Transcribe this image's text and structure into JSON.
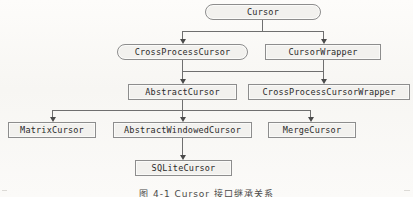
{
  "figure": {
    "kind": "class-hierarchy-diagram",
    "caption": "图 4-1  Cursor 接口继承关系",
    "colors": {
      "page_background": "#fbfaf8",
      "node_fill": "#f2f1ee",
      "node_border": "#8d8d8d",
      "connector": "#6f6f6f",
      "arrow": "#4a4a4a",
      "text": "#2a2a2a"
    }
  },
  "nodes": [
    {
      "id": "cursor",
      "label": "Cursor",
      "shape": "rounded",
      "level": 1,
      "x": 205,
      "y": 4,
      "w": 116,
      "h": 16
    },
    {
      "id": "cross_process_cursor",
      "label": "CrossProcessCursor",
      "shape": "rounded",
      "level": 2,
      "x": 117,
      "y": 44,
      "w": 131,
      "h": 16
    },
    {
      "id": "cursor_wrapper",
      "label": "CursorWrapper",
      "shape": "rectangle",
      "level": 2,
      "x": 265,
      "y": 44,
      "w": 116,
      "h": 16
    },
    {
      "id": "abstract_cursor",
      "label": "AbstractCursor",
      "shape": "rectangle",
      "level": 3,
      "x": 128,
      "y": 84,
      "w": 109,
      "h": 16
    },
    {
      "id": "cross_process_cursor_wrap",
      "label": "CrossProcessCursorWrapper",
      "shape": "rectangle",
      "level": 3,
      "x": 248,
      "y": 84,
      "w": 162,
      "h": 16
    },
    {
      "id": "matrix_cursor",
      "label": "MatrixCursor",
      "shape": "rectangle",
      "level": 4,
      "x": 8,
      "y": 122,
      "w": 88,
      "h": 16
    },
    {
      "id": "abstract_windowed_cursor",
      "label": "AbstractWindowedCursor",
      "shape": "rectangle",
      "level": 4,
      "x": 113,
      "y": 122,
      "w": 139,
      "h": 16
    },
    {
      "id": "merge_cursor",
      "label": "MergeCursor",
      "shape": "rectangle",
      "level": 4,
      "x": 268,
      "y": 122,
      "w": 88,
      "h": 16
    },
    {
      "id": "sqlite_cursor",
      "label": "SQLiteCursor",
      "shape": "rectangle",
      "level": 5,
      "x": 135,
      "y": 160,
      "w": 97,
      "h": 16
    }
  ],
  "edges": [
    {
      "from": "cursor",
      "to": "cross_process_cursor"
    },
    {
      "from": "cursor",
      "to": "cursor_wrapper"
    },
    {
      "from": "cross_process_cursor",
      "to": "abstract_cursor"
    },
    {
      "from": "cursor_wrapper",
      "to": "cross_process_cursor_wrap"
    },
    {
      "from": "abstract_cursor",
      "to": "matrix_cursor"
    },
    {
      "from": "abstract_cursor",
      "to": "abstract_windowed_cursor"
    },
    {
      "from": "abstract_cursor",
      "to": "merge_cursor"
    },
    {
      "from": "abstract_windowed_cursor",
      "to": "sqlite_cursor"
    }
  ]
}
